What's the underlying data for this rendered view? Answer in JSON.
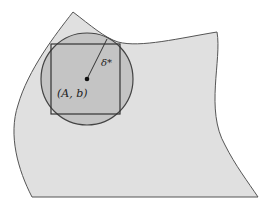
{
  "diagram": {
    "region": {
      "fill": "#e0e0e0",
      "stroke": "#555555"
    },
    "circle": {
      "cx": 87,
      "cy": 79,
      "r": 46,
      "fill": "#c4c4c4",
      "stroke": "#444444"
    },
    "square": {
      "x": 51,
      "y": 44,
      "w": 69,
      "h": 70,
      "stroke": "#333333"
    },
    "center_point": {
      "x": 87,
      "y": 79
    },
    "radius_line": {
      "x1": 87,
      "y1": 79,
      "x2": 107,
      "y2": 39
    },
    "labels": {
      "center": "(A, b)",
      "radius": "δ*"
    }
  }
}
